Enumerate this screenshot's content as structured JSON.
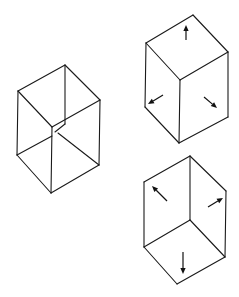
{
  "figure": {
    "width": 239,
    "height": 297,
    "background": "#ffffff",
    "line_color": "#1a1a1a",
    "panels": [
      {
        "id": "necker-cube",
        "description": "Ambiguous wireframe cube (Necker cube) with a break at the crossing of the central verticals",
        "edges": [
          [
            18,
            91,
            65,
            65
          ],
          [
            65,
            65,
            100,
            100
          ],
          [
            18,
            91,
            52,
            127
          ],
          [
            52,
            127,
            100,
            100
          ],
          [
            18,
            91,
            17,
            155
          ],
          [
            100,
            100,
            99,
            165
          ],
          [
            52,
            127,
            51,
            193
          ],
          [
            17,
            155,
            51,
            193
          ],
          [
            51,
            193,
            99,
            165
          ],
          [
            65,
            65,
            65,
            124
          ],
          [
            17,
            155,
            52,
            136
          ],
          [
            58,
            133,
            99,
            165
          ],
          [
            55,
            132,
            65,
            124
          ]
        ]
      },
      {
        "id": "convex-cube",
        "description": "Cube seen as a convex solid, arrows point outward from each face",
        "edges": [
          [
            146,
            43,
            193,
            15
          ],
          [
            193,
            15,
            228,
            52
          ],
          [
            146,
            43,
            180,
            80
          ],
          [
            180,
            80,
            228,
            52
          ],
          [
            146,
            43,
            145,
            107
          ],
          [
            228,
            52,
            228,
            117
          ],
          [
            180,
            80,
            179,
            143
          ],
          [
            145,
            107,
            179,
            143
          ],
          [
            179,
            143,
            228,
            117
          ]
        ],
        "arrows": [
          {
            "direction": "up",
            "from": [
              186,
              40
            ],
            "to": [
              186,
              25
            ]
          },
          {
            "direction": "down-left",
            "from": [
              163,
              95
            ],
            "to": [
              148,
              104
            ]
          },
          {
            "direction": "down-right",
            "from": [
              204,
              97
            ],
            "to": [
              217,
              108
            ]
          }
        ]
      },
      {
        "id": "concave-cube",
        "description": "Same outline seen as a concave corner, arrows point into each face",
        "edges": [
          [
            144,
            182,
            190,
            156
          ],
          [
            190,
            156,
            226,
            191
          ],
          [
            144,
            182,
            144,
            247
          ],
          [
            226,
            191,
            225,
            257
          ],
          [
            190,
            156,
            190,
            220
          ],
          [
            144,
            247,
            190,
            220
          ],
          [
            190,
            220,
            225,
            257
          ],
          [
            144,
            247,
            177,
            284
          ],
          [
            177,
            284,
            225,
            257
          ]
        ],
        "arrows": [
          {
            "direction": "up-left",
            "from": [
              167,
              201
            ],
            "to": [
              152,
              186
            ]
          },
          {
            "direction": "up-right",
            "from": [
              208,
              207
            ],
            "to": [
              223,
              198
            ]
          },
          {
            "direction": "down",
            "from": [
              183,
              252
            ],
            "to": [
              183,
              274
            ]
          }
        ]
      }
    ]
  }
}
